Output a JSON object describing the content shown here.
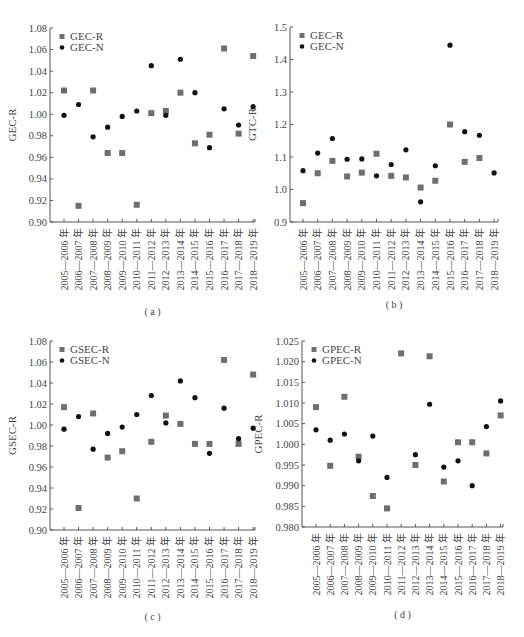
{
  "figure_caption": "",
  "chart_data": [
    {
      "id": "a",
      "type": "scatter",
      "caption": "( a )",
      "title": "",
      "xlabel": "",
      "ylabel": "GEC-R",
      "ylim": [
        0.9,
        1.08
      ],
      "yticks": [
        0.9,
        0.92,
        0.94,
        0.96,
        0.98,
        1.0,
        1.02,
        1.04,
        1.06,
        1.08
      ],
      "ytick_labels": [
        "0.90",
        "0.92",
        "0.94",
        "0.96",
        "0.98",
        "1.00",
        "1.02",
        "1.04",
        "1.06",
        "1.08"
      ],
      "legend_position": "upper-left",
      "categories": [
        "2005—2006 年",
        "2006—2007 年",
        "2007—2008 年",
        "2008—2009 年",
        "2009—2010 年",
        "2010—2011 年",
        "2011—2012 年",
        "2012—2013 年",
        "2013—2014 年",
        "2014—2015 年",
        "2015—2016 年",
        "2016—2017 年",
        "2017—2018 年",
        "2018—2019 年"
      ],
      "series": [
        {
          "name": "GEC-R",
          "marker": "square",
          "color": "#6e6e6e",
          "values": [
            1.022,
            0.915,
            1.022,
            0.964,
            0.964,
            0.916,
            1.001,
            1.003,
            1.02,
            0.973,
            0.981,
            1.061,
            0.982,
            1.054
          ]
        },
        {
          "name": "GEC-N",
          "marker": "circle",
          "color": "#111111",
          "values": [
            0.999,
            1.009,
            0.979,
            0.988,
            0.998,
            1.003,
            1.045,
            0.999,
            1.051,
            1.02,
            0.969,
            1.005,
            0.99,
            1.007
          ]
        }
      ]
    },
    {
      "id": "b",
      "type": "scatter",
      "caption": "( b )",
      "title": "",
      "xlabel": "",
      "ylabel": "GTC-R",
      "ylim": [
        0.9,
        1.5
      ],
      "yticks": [
        0.9,
        1.0,
        1.1,
        1.2,
        1.3,
        1.4,
        1.5
      ],
      "ytick_labels": [
        "0.9",
        "1.0",
        "1.1",
        "1.2",
        "1.3",
        "1.4",
        "1.5"
      ],
      "legend_position": "upper-left",
      "categories": [
        "2005—2006 年",
        "2006—2007 年",
        "2007—2008 年",
        "2008—2009 年",
        "2009—2010 年",
        "2010—2011 年",
        "2011—2012 年",
        "2012—2013 年",
        "2013—2014 年",
        "2014—2015 年",
        "2015—2016 年",
        "2016—2017 年",
        "2017—2018 年",
        "2018—2019 年"
      ],
      "series": [
        {
          "name": "GEC-R",
          "marker": "square",
          "color": "#6e6e6e",
          "values": [
            0.958,
            1.05,
            1.088,
            1.04,
            1.052,
            1.11,
            1.042,
            1.037,
            1.006,
            1.027,
            1.2,
            1.085,
            1.097,
            null
          ]
        },
        {
          "name": "GEC-N",
          "marker": "circle",
          "color": "#111111",
          "values": [
            1.058,
            1.112,
            1.157,
            1.093,
            1.094,
            1.042,
            1.077,
            1.122,
            0.962,
            1.073,
            1.444,
            1.178,
            1.167,
            1.051
          ]
        }
      ]
    },
    {
      "id": "c",
      "type": "scatter",
      "caption": "( c )",
      "title": "",
      "xlabel": "",
      "ylabel": "GSEC-R",
      "ylim": [
        0.9,
        1.08
      ],
      "yticks": [
        0.9,
        0.92,
        0.94,
        0.96,
        0.98,
        1.0,
        1.02,
        1.04,
        1.06,
        1.08
      ],
      "ytick_labels": [
        "0.90",
        "0.92",
        "0.94",
        "0.96",
        "0.98",
        "1.00",
        "1.02",
        "1.04",
        "1.06",
        "1.08"
      ],
      "legend_position": "upper-left",
      "categories": [
        "2005—2006 年",
        "2006—2007 年",
        "2007—2008 年",
        "2008—2009 年",
        "2009—2010 年",
        "2010—2011 年",
        "2011—2012 年",
        "2012—2013 年",
        "2013—2014 年",
        "2014—2015 年",
        "2015—2016 年",
        "2016—2017 年",
        "2017—2018 年",
        "2018—2019 年"
      ],
      "series": [
        {
          "name": "GSEC-R",
          "marker": "square",
          "color": "#6e6e6e",
          "values": [
            1.017,
            0.921,
            1.011,
            0.969,
            0.975,
            0.93,
            0.984,
            1.009,
            1.001,
            0.982,
            0.982,
            1.062,
            0.982,
            1.048
          ]
        },
        {
          "name": "GSEC-N",
          "marker": "circle",
          "color": "#111111",
          "values": [
            0.996,
            1.008,
            0.977,
            0.992,
            0.998,
            1.01,
            1.028,
            1.002,
            1.042,
            1.026,
            0.973,
            1.016,
            0.987,
            0.997
          ]
        }
      ]
    },
    {
      "id": "d",
      "type": "scatter",
      "caption": "( d )",
      "title": "",
      "xlabel": "",
      "ylabel": "GPEC-R",
      "ylim": [
        0.98,
        1.025
      ],
      "yticks": [
        0.98,
        0.985,
        0.99,
        0.995,
        1.0,
        1.005,
        1.01,
        1.015,
        1.02,
        1.025
      ],
      "ytick_labels": [
        "0.980",
        "0.985",
        "0.990",
        "0.995",
        "1.000",
        "1.005",
        "1.010",
        "1.015",
        "1.020",
        "1.025"
      ],
      "legend_position": "upper-left",
      "categories": [
        "2005—2006 年",
        "2006—2007 年",
        "2007—2008 年",
        "2008—2009 年",
        "2009—2010 年",
        "2010—2011 年",
        "2011—2012 年",
        "2012—2013 年",
        "2013—2014 年",
        "2014—2015 年",
        "2015—2016 年",
        "2016—2017 年",
        "2017—2018 年",
        "2018—2019 年"
      ],
      "series": [
        {
          "name": "GPEC-R",
          "marker": "square",
          "color": "#6e6e6e",
          "values": [
            1.009,
            0.9948,
            1.0115,
            0.997,
            0.9875,
            0.9845,
            1.022,
            0.995,
            1.0213,
            0.991,
            1.0005,
            1.0005,
            0.9978,
            1.007
          ]
        },
        {
          "name": "GPEC-N",
          "marker": "circle",
          "color": "#111111",
          "values": [
            1.0035,
            1.001,
            1.0025,
            0.996,
            1.002,
            0.992,
            null,
            0.9975,
            1.0097,
            0.9945,
            0.996,
            0.99,
            1.0043,
            1.0105
          ]
        }
      ]
    }
  ],
  "layout": {
    "panels": [
      {
        "id": "a",
        "left": 0,
        "top": 0,
        "axis_x0": 50,
        "axis_x1": 255,
        "axis_y_top": 28,
        "axis_y_bottom": 222,
        "first_tick": 64,
        "tick_step": 14.55,
        "caption_y": 315
      },
      {
        "id": "b",
        "left": 0,
        "top": 0,
        "axis_x0": 290,
        "axis_x1": 498,
        "axis_y_top": 27,
        "axis_y_bottom": 222,
        "first_tick": 303,
        "tick_step": 14.7,
        "caption_y": 308
      },
      {
        "id": "c",
        "left": 0,
        "top": 0,
        "axis_x0": 50,
        "axis_x1": 255,
        "axis_y_top": 341,
        "axis_y_bottom": 530,
        "first_tick": 64,
        "tick_step": 14.55,
        "caption_y": 620
      },
      {
        "id": "d",
        "left": 0,
        "top": 0,
        "axis_x0": 302,
        "axis_x1": 503,
        "axis_y_top": 341,
        "axis_y_bottom": 527,
        "first_tick": 316,
        "tick_step": 14.2,
        "caption_y": 618
      }
    ]
  }
}
